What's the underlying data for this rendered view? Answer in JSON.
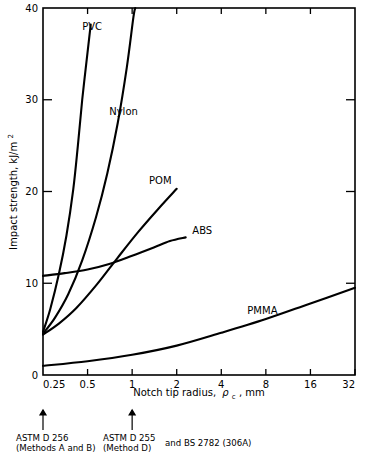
{
  "chart_data": {
    "type": "line",
    "title": "",
    "xlabel": "Notch tip radius, ρc, mm",
    "xlabel_main": "Notch tip radius,",
    "xlabel_sym": "ρ",
    "xlabel_sub": "c",
    "xlabel_unit": ", mm",
    "ylabel": "Impact strength, kJ/m²",
    "ylabel_main": "Impact strength, kJ/m",
    "ylabel_sup": "2",
    "xscale": "log2",
    "xlim": [
      0.25,
      32
    ],
    "ylim": [
      0,
      40
    ],
    "xticks": [
      0.25,
      0.5,
      1,
      2,
      4,
      8,
      16,
      32
    ],
    "xtick_labels": [
      "0.25",
      "0.5",
      "1",
      "2",
      "4",
      "8",
      "16",
      "32"
    ],
    "yticks": [
      0,
      10,
      20,
      30,
      40
    ],
    "ytick_labels": [
      "0",
      "10",
      "20",
      "30",
      "40"
    ],
    "grid": false,
    "legend_position": "inline-annotations",
    "series": [
      {
        "name": "PVC",
        "label": "PVC",
        "label_x": 0.46,
        "label_y": 37.6,
        "points": [
          [
            0.25,
            4.7
          ],
          [
            0.28,
            7.2
          ],
          [
            0.32,
            11.0
          ],
          [
            0.36,
            15.2
          ],
          [
            0.4,
            20.2
          ],
          [
            0.43,
            25.0
          ],
          [
            0.46,
            30.0
          ],
          [
            0.5,
            35.2
          ],
          [
            0.525,
            38.2
          ]
        ]
      },
      {
        "name": "Nylon",
        "label": "Nylon",
        "label_x": 0.7,
        "label_y": 28.3,
        "points": [
          [
            0.25,
            4.5
          ],
          [
            0.3,
            6.2
          ],
          [
            0.37,
            8.8
          ],
          [
            0.46,
            12.5
          ],
          [
            0.57,
            17.2
          ],
          [
            0.68,
            22.0
          ],
          [
            0.8,
            27.5
          ],
          [
            0.92,
            33.5
          ],
          [
            1.02,
            39.0
          ],
          [
            1.05,
            40.0
          ]
        ]
      },
      {
        "name": "POM",
        "label": "POM",
        "label_x": 1.3,
        "label_y": 20.8,
        "points": [
          [
            0.25,
            4.4
          ],
          [
            0.32,
            5.6
          ],
          [
            0.42,
            7.3
          ],
          [
            0.58,
            9.9
          ],
          [
            0.8,
            12.8
          ],
          [
            1.1,
            15.6
          ],
          [
            1.5,
            18.1
          ],
          [
            2.0,
            20.3
          ]
        ]
      },
      {
        "name": "ABS",
        "label": "ABS",
        "label_x": 2.55,
        "label_y": 15.4,
        "points": [
          [
            0.25,
            10.8
          ],
          [
            0.35,
            11.1
          ],
          [
            0.5,
            11.5
          ],
          [
            0.7,
            12.1
          ],
          [
            1.0,
            13.0
          ],
          [
            1.4,
            13.9
          ],
          [
            1.8,
            14.6
          ],
          [
            2.3,
            15.0
          ]
        ]
      },
      {
        "name": "PMMA",
        "label": "PMMA",
        "label_x": 6.0,
        "label_y": 6.6,
        "points": [
          [
            0.25,
            1.0
          ],
          [
            0.5,
            1.5
          ],
          [
            1.0,
            2.2
          ],
          [
            2.0,
            3.2
          ],
          [
            4.0,
            4.6
          ],
          [
            8.0,
            6.1
          ],
          [
            16.0,
            7.8
          ],
          [
            32.0,
            9.5
          ]
        ]
      }
    ],
    "annotations": [
      {
        "name": "astm-d256-note",
        "arrow_x": 0.25,
        "lines": [
          "ASTM D 256",
          "(Methods A and B)"
        ]
      },
      {
        "name": "astm-d255-note",
        "arrow_x": 1.0,
        "lines": [
          "ASTM D 255",
          "(Method D)"
        ],
        "suffix": "and BS 2782 (306A)"
      }
    ]
  },
  "colors": {
    "ink": "#000000",
    "background": "#ffffff"
  }
}
